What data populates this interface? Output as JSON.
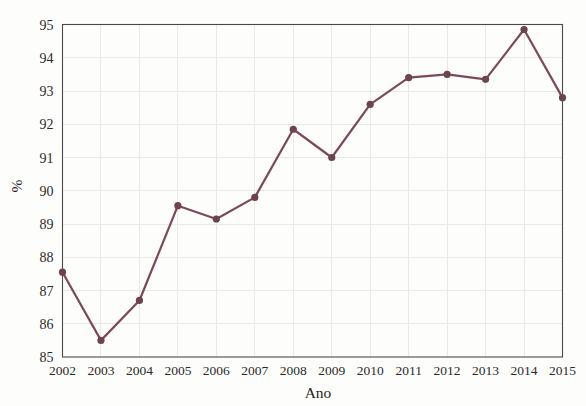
{
  "chart_data": {
    "type": "line",
    "title": "",
    "xlabel": "Ano",
    "ylabel": "%",
    "categories": [
      "2002",
      "2003",
      "2004",
      "2005",
      "2006",
      "2007",
      "2008",
      "2009",
      "2010",
      "2011",
      "2012",
      "2013",
      "2014",
      "2015"
    ],
    "values": [
      87.55,
      85.5,
      86.7,
      89.55,
      89.15,
      89.8,
      91.85,
      91.0,
      92.6,
      93.4,
      93.5,
      93.35,
      94.85,
      92.8
    ],
    "series": [
      {
        "name": "%",
        "values": [
          87.55,
          85.5,
          86.7,
          89.55,
          89.15,
          89.8,
          91.85,
          91.0,
          92.6,
          93.4,
          93.5,
          93.35,
          94.85,
          92.8
        ]
      }
    ],
    "ylim": [
      85,
      95
    ],
    "ytick_labels": [
      "85",
      "86",
      "87",
      "88",
      "89",
      "90",
      "91",
      "92",
      "93",
      "94",
      "95"
    ],
    "ytick_values": [
      85,
      86,
      87,
      88,
      89,
      90,
      91,
      92,
      93,
      94,
      95
    ],
    "xtick_labels": [
      "2002",
      "2003",
      "2004",
      "2005",
      "2006",
      "2007",
      "2008",
      "2009",
      "2010",
      "2011",
      "2012",
      "2013",
      "2014",
      "2015"
    ],
    "grid": true,
    "legend": "none",
    "marker": "circle",
    "line_color": "#7b4a57",
    "marker_color": "#6e4351",
    "grid_color": "#e9e9ea",
    "frame_color": "#4a4a4a",
    "background_color": "#fdfdfc"
  }
}
